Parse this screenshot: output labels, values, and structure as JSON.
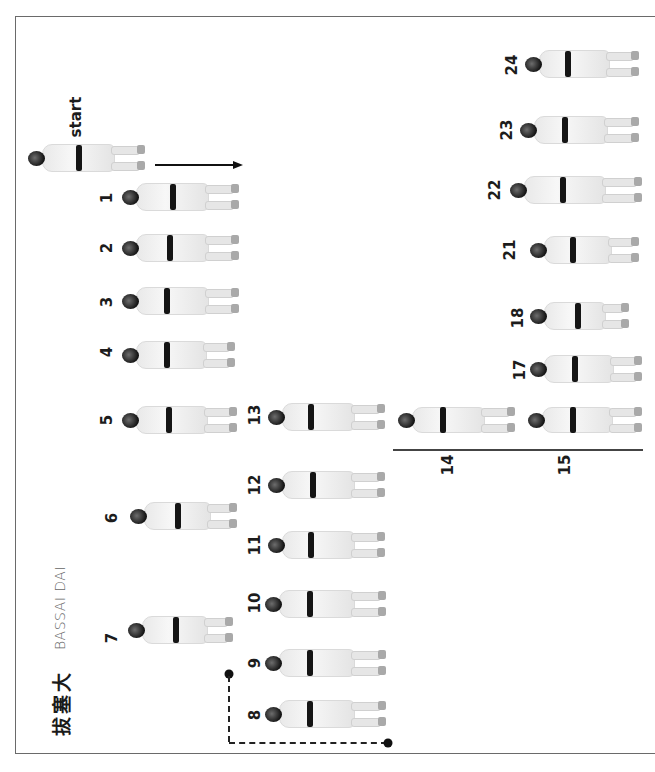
{
  "page": {
    "title_japanese": "拔塞大",
    "title_english": "BASSAI DAI",
    "start_label": "start",
    "orientation": "rotated -90deg"
  },
  "colors": {
    "frame": "#6a6a6a",
    "ink": "#1c1c1c",
    "gi": "#efefef",
    "belt": "#151515"
  },
  "steps": [
    {
      "label": "1",
      "num_x": 107,
      "num_y": 198,
      "fig": {
        "x": 122,
        "y": 180,
        "w": 118,
        "h": 34,
        "belt_x": 48
      }
    },
    {
      "label": "2",
      "num_x": 107,
      "num_y": 248,
      "fig": {
        "x": 122,
        "y": 232,
        "w": 118,
        "h": 32,
        "belt_x": 45
      }
    },
    {
      "label": "3",
      "num_x": 107,
      "num_y": 302,
      "fig": {
        "x": 122,
        "y": 285,
        "w": 118,
        "h": 32,
        "belt_x": 42
      }
    },
    {
      "label": "4",
      "num_x": 107,
      "num_y": 352,
      "fig": {
        "x": 122,
        "y": 335,
        "w": 114,
        "h": 40,
        "belt_x": 42
      }
    },
    {
      "label": "5",
      "num_x": 107,
      "num_y": 420,
      "fig": {
        "x": 122,
        "y": 400,
        "w": 116,
        "h": 40,
        "belt_x": 44
      }
    },
    {
      "label": "6",
      "num_x": 112,
      "num_y": 518,
      "fig": {
        "x": 130,
        "y": 478,
        "w": 108,
        "h": 76,
        "belt_x": 45
      }
    },
    {
      "label": "7",
      "num_x": 112,
      "num_y": 638,
      "fig": {
        "x": 128,
        "y": 585,
        "w": 106,
        "h": 90,
        "belt_x": 45
      }
    },
    {
      "label": "8",
      "num_x": 255,
      "num_y": 715,
      "fig": {
        "x": 265,
        "y": 690,
        "w": 122,
        "h": 48,
        "belt_x": 42
      }
    },
    {
      "label": "9",
      "num_x": 255,
      "num_y": 663,
      "fig": {
        "x": 265,
        "y": 640,
        "w": 122,
        "h": 46,
        "belt_x": 42
      }
    },
    {
      "label": "10",
      "num_x": 255,
      "num_y": 603,
      "fig": {
        "x": 265,
        "y": 580,
        "w": 122,
        "h": 48,
        "belt_x": 42
      }
    },
    {
      "label": "11",
      "num_x": 255,
      "num_y": 545,
      "fig": {
        "x": 268,
        "y": 522,
        "w": 118,
        "h": 46,
        "belt_x": 40
      }
    },
    {
      "label": "12",
      "num_x": 255,
      "num_y": 485,
      "fig": {
        "x": 268,
        "y": 462,
        "w": 118,
        "h": 46,
        "belt_x": 42
      }
    },
    {
      "label": "13",
      "num_x": 255,
      "num_y": 415,
      "fig": {
        "x": 268,
        "y": 393,
        "w": 118,
        "h": 48,
        "belt_x": 40
      }
    },
    {
      "label": "14",
      "num_x": 448,
      "num_y": 465,
      "fig": {
        "x": 398,
        "y": 405,
        "w": 118,
        "h": 30,
        "belt_x": 42
      }
    },
    {
      "label": "15",
      "num_x": 565,
      "num_y": 465,
      "fig": {
        "x": 528,
        "y": 405,
        "w": 115,
        "h": 30,
        "belt_x": 42
      }
    },
    {
      "label": "17",
      "num_x": 520,
      "num_y": 370,
      "fig": {
        "x": 530,
        "y": 352,
        "w": 113,
        "h": 34,
        "belt_x": 42
      }
    },
    {
      "label": "18",
      "num_x": 518,
      "num_y": 318,
      "fig": {
        "x": 530,
        "y": 298,
        "w": 100,
        "h": 36,
        "belt_x": 45
      }
    },
    {
      "label": "21",
      "num_x": 510,
      "num_y": 250,
      "fig": {
        "x": 530,
        "y": 228,
        "w": 110,
        "h": 44,
        "belt_x": 40
      }
    },
    {
      "label": "22",
      "num_x": 495,
      "num_y": 190,
      "fig": {
        "x": 510,
        "y": 165,
        "w": 133,
        "h": 50,
        "belt_x": 50
      }
    },
    {
      "label": "23",
      "num_x": 507,
      "num_y": 130,
      "fig": {
        "x": 520,
        "y": 112,
        "w": 120,
        "h": 36,
        "belt_x": 42
      }
    },
    {
      "label": "24",
      "num_x": 512,
      "num_y": 65,
      "fig": {
        "x": 525,
        "y": 45,
        "w": 115,
        "h": 38,
        "belt_x": 40
      }
    }
  ],
  "start_figure": {
    "x": 28,
    "y": 140,
    "w": 118,
    "h": 36,
    "belt_x": 48
  },
  "start_label_pos": {
    "x": 76,
    "y": 117
  },
  "title_jp_pos": {
    "x": 60,
    "y": 703
  },
  "title_en_pos": {
    "x": 60,
    "y": 608
  }
}
